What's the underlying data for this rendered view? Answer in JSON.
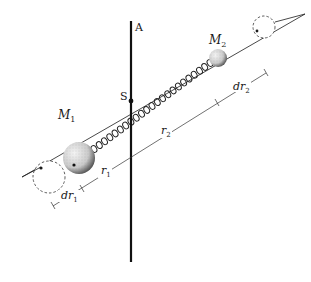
{
  "diagram": {
    "type": "physics-schematic",
    "labels": {
      "axis": "A",
      "pivot": "S",
      "mass1_base": "M",
      "mass1_sub": "1",
      "mass2_base": "M",
      "mass2_sub": "2",
      "r1_base": "r",
      "r1_sub": "1",
      "r2_base": "r",
      "r2_sub": "2",
      "dr1_base": "dr",
      "dr1_sub": "1",
      "dr2_base": "dr",
      "dr2_sub": "2"
    },
    "colors": {
      "ink": "#1a1a1a",
      "mass_fill": "#d8d8d8",
      "background": "#ffffff"
    }
  }
}
